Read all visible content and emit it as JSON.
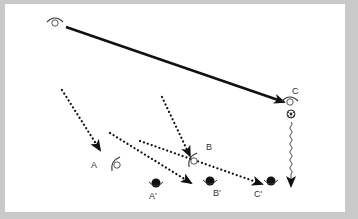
{
  "diagram": {
    "colors": {
      "border": "#c9c9c9",
      "background": "#ffffff",
      "ink": "#111111"
    },
    "observers": [
      {
        "id": "origin",
        "label": "",
        "x": 55,
        "y": 22,
        "type": "eye-open"
      },
      {
        "id": "C",
        "label": "C",
        "x": 290,
        "y": 101,
        "label_x": 292,
        "label_y": 94,
        "type": "eye-open"
      },
      {
        "id": "A",
        "label": "A",
        "x": 116,
        "y": 165,
        "label_x": 91,
        "label_y": 168,
        "type": "eye-side"
      },
      {
        "id": "B",
        "label": "B",
        "x": 193,
        "y": 161,
        "label_x": 206,
        "label_y": 150,
        "type": "eye-side"
      },
      {
        "id": "A-prime",
        "label": "A'",
        "x": 156,
        "y": 183,
        "label_x": 149,
        "label_y": 199,
        "type": "head"
      },
      {
        "id": "B-prime",
        "label": "B'",
        "x": 210,
        "y": 181,
        "label_x": 213,
        "label_y": 196,
        "type": "head"
      },
      {
        "id": "C-prime",
        "label": "C'",
        "x": 271,
        "y": 181,
        "label_x": 254,
        "label_y": 197,
        "type": "head"
      }
    ],
    "ball": {
      "x": 291,
      "y": 114
    },
    "solid_arrow": {
      "x1": 66,
      "y1": 27,
      "x2": 284,
      "y2": 102
    },
    "dotted_arrows": [
      {
        "x1": 62,
        "y1": 90,
        "x2": 100,
        "y2": 150
      },
      {
        "x1": 162,
        "y1": 97,
        "x2": 190,
        "y2": 156
      },
      {
        "x1": 110,
        "y1": 133,
        "x2": 191,
        "y2": 183
      },
      {
        "x1": 140,
        "y1": 141,
        "x2": 262,
        "y2": 184
      }
    ],
    "wavy_arrow": {
      "x": 291,
      "y1": 122,
      "y2": 186
    }
  }
}
